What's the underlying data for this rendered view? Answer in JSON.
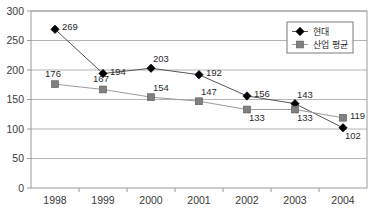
{
  "chart_data": {
    "type": "line",
    "title": "",
    "xlabel": "",
    "ylabel": "",
    "categories": [
      "1998",
      "1999",
      "2000",
      "2001",
      "2002",
      "2003",
      "2004"
    ],
    "series": [
      {
        "name": "현대",
        "marker": "diamond",
        "color": "#000000",
        "values": [
          269,
          194,
          203,
          192,
          156,
          143,
          102
        ],
        "label_positions": [
          "right",
          "right",
          "above",
          "right",
          "right",
          "above",
          "below"
        ]
      },
      {
        "name": "산업 평균",
        "marker": "square",
        "color": "#808080",
        "values": [
          176,
          167,
          154,
          147,
          133,
          133,
          119
        ],
        "label_positions": [
          "above-left",
          "above-left",
          "above",
          "above",
          "below",
          "below",
          "right"
        ]
      }
    ],
    "ylim": [
      0,
      300
    ],
    "yticks": [
      0,
      50,
      100,
      150,
      200,
      250,
      300
    ],
    "ytick_labels": [
      "0",
      "50",
      "100",
      "150",
      "200",
      "250",
      "300"
    ],
    "grid": true,
    "grid_axis": "y",
    "legend_position": "top-right",
    "legend_entries": [
      "현대",
      "산업 평균"
    ]
  },
  "axes": {
    "frame_color": "#9a9a9a",
    "grid_color": "#b4b4b4",
    "tick_text_color": "#3a3a3a"
  },
  "legend": {
    "border_color": "#7a7a7a",
    "background": "#ffffff",
    "items": [
      {
        "label": "현대",
        "marker": "diamond-marker",
        "color": "#000000"
      },
      {
        "label": "산업 평균",
        "marker": "square-marker",
        "color": "#808080"
      }
    ]
  }
}
